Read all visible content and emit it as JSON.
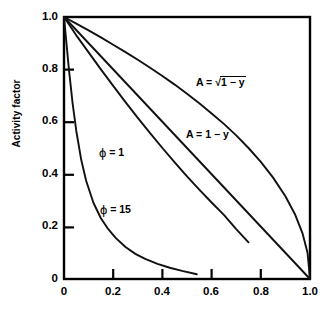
{
  "chart_data": {
    "type": "line",
    "title": "",
    "xlabel": "",
    "ylabel": "Activity factor",
    "xlim": [
      0,
      1.0
    ],
    "ylim": [
      0,
      1.0
    ],
    "xticks": [
      "0",
      "0.2",
      "0.4",
      "0.6",
      "0.8",
      "1.0"
    ],
    "xtick_values": [
      0,
      0.2,
      0.4,
      0.6,
      0.8,
      1.0
    ],
    "yticks": [
      "0",
      "0.2",
      "0.4",
      "0.6",
      "0.8",
      "1.0"
    ],
    "ytick_values": [
      0,
      0.2,
      0.4,
      0.6,
      0.8,
      1.0
    ],
    "grid": false,
    "legend_position": "inline-annotations",
    "series": [
      {
        "name": "A = sqrt(1 - y)",
        "label_text": "A = √1 − y",
        "x": [
          0.0,
          0.05,
          0.1,
          0.15,
          0.2,
          0.25,
          0.3,
          0.35,
          0.4,
          0.45,
          0.5,
          0.55,
          0.6,
          0.65,
          0.7,
          0.75,
          0.8,
          0.85,
          0.9,
          0.94,
          0.97,
          0.99,
          1.0
        ],
        "values": [
          1.0,
          0.975,
          0.949,
          0.922,
          0.894,
          0.866,
          0.837,
          0.806,
          0.775,
          0.742,
          0.707,
          0.671,
          0.632,
          0.592,
          0.548,
          0.5,
          0.447,
          0.387,
          0.316,
          0.245,
          0.173,
          0.1,
          0.0
        ]
      },
      {
        "name": "A = 1 - y",
        "label_text": "A = 1 − y",
        "x": [
          0.0,
          1.0
        ],
        "values": [
          1.0,
          0.0
        ]
      },
      {
        "name": "phi = 1",
        "label_text": "ϕ = 1",
        "x": [
          0.0,
          0.05,
          0.1,
          0.15,
          0.2,
          0.25,
          0.3,
          0.35,
          0.4,
          0.45,
          0.5,
          0.55,
          0.6,
          0.65,
          0.7,
          0.75
        ],
        "values": [
          1.0,
          0.93,
          0.865,
          0.8,
          0.737,
          0.675,
          0.615,
          0.557,
          0.5,
          0.445,
          0.392,
          0.341,
          0.292,
          0.245,
          0.19,
          0.14
        ]
      },
      {
        "name": "phi = 15",
        "label_text": "ϕ = 15",
        "x": [
          0.0,
          0.01,
          0.02,
          0.035,
          0.05,
          0.07,
          0.09,
          0.12,
          0.15,
          0.18,
          0.21,
          0.25,
          0.29,
          0.33,
          0.38,
          0.43,
          0.48,
          0.54
        ],
        "values": [
          1.0,
          0.9,
          0.8,
          0.67,
          0.565,
          0.455,
          0.375,
          0.29,
          0.232,
          0.19,
          0.157,
          0.122,
          0.096,
          0.077,
          0.058,
          0.043,
          0.031,
          0.018
        ]
      }
    ]
  },
  "axes": {
    "y_title": "Activity factor"
  },
  "annotations": {
    "sqrt_label_prefix": "A = ",
    "sqrt_symbol": "√",
    "sqrt_radicand": "1 − y",
    "linear_label": "A = 1 − y",
    "phi1_symbol": "ϕ",
    "phi1_rest": " = 1",
    "phi15_symbol": "ϕ",
    "phi15_rest": " = 15"
  },
  "style": {
    "line_color": "#111111",
    "axis_color": "#000000",
    "background": "#ffffff"
  }
}
